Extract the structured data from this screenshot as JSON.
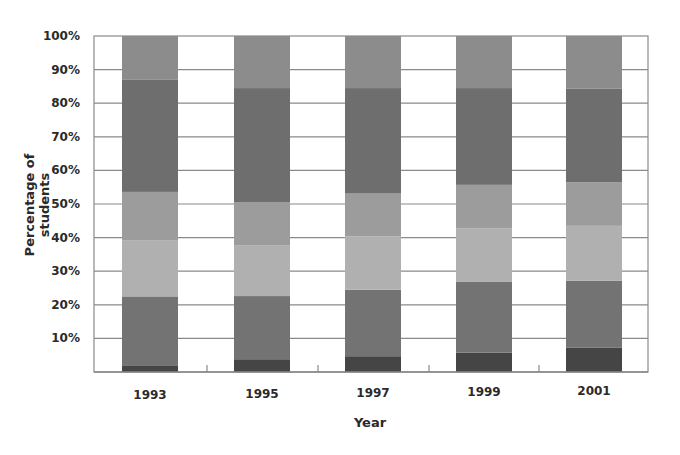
{
  "chart_data": {
    "type": "bar",
    "stacked": true,
    "normalized_percent": true,
    "title": "",
    "xlabel": "Year",
    "ylabel": "Percentage of students",
    "ylim": [
      0,
      100
    ],
    "yticks": [
      "10%",
      "20%",
      "30%",
      "40%",
      "50%",
      "60%",
      "70%",
      "80%",
      "90%",
      "100%"
    ],
    "grid": true,
    "legend": null,
    "categories": [
      "1993",
      "1995",
      "1997",
      "1999",
      "2001"
    ],
    "series": [
      {
        "name": "Segment 1 (bottom)",
        "color": "#454545",
        "values": [
          2.0,
          3.8,
          4.7,
          5.8,
          7.2
        ]
      },
      {
        "name": "Segment 2",
        "color": "#737373",
        "values": [
          20.5,
          18.8,
          19.8,
          21.0,
          20.0
        ]
      },
      {
        "name": "Segment 3",
        "color": "#b0b0b0",
        "values": [
          16.6,
          15.0,
          15.9,
          16.0,
          16.3
        ]
      },
      {
        "name": "Segment 4",
        "color": "#9c9c9c",
        "values": [
          14.5,
          13.0,
          12.7,
          12.9,
          13.0
        ]
      },
      {
        "name": "Segment 5",
        "color": "#6e6e6e",
        "values": [
          33.5,
          33.9,
          31.4,
          28.8,
          27.9
        ]
      },
      {
        "name": "Segment 6 (top)",
        "color": "#8c8c8c",
        "values": [
          12.9,
          15.5,
          15.5,
          15.5,
          15.6
        ]
      }
    ]
  },
  "labels": {
    "xlabel": "Year",
    "ylabel": "Percentage of students"
  }
}
